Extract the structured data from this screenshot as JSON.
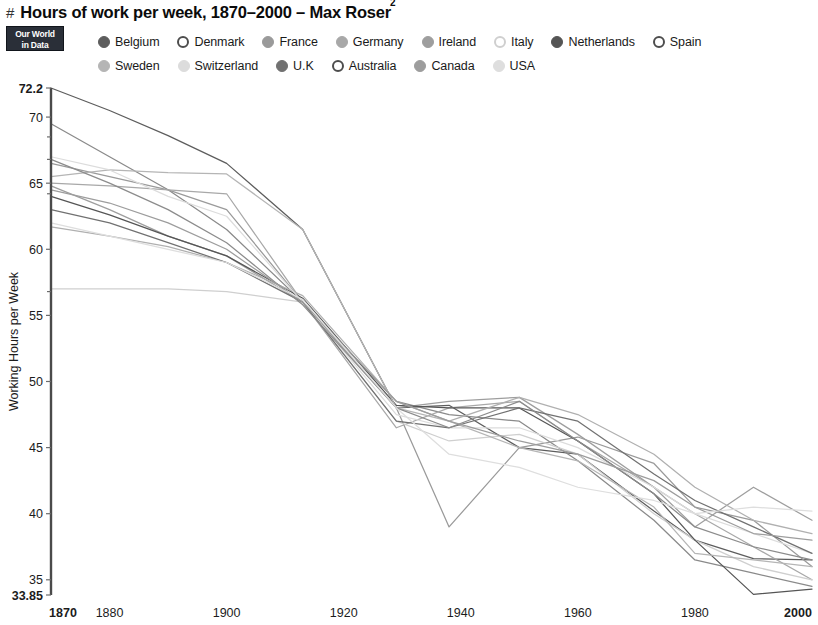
{
  "header": {
    "hash": "#",
    "title": "Hours of work per week, 1870–2000 – Max Roser",
    "title_superscript": "2"
  },
  "logo": {
    "line1": "Our World",
    "line2": "in Data"
  },
  "legend": {
    "rows": [
      [
        {
          "label": "Belgium",
          "color": "#5d5d5d",
          "filled": true
        },
        {
          "label": "Denmark",
          "color": "#4d4d4d",
          "filled": false
        },
        {
          "label": "France",
          "color": "#9a9a9a",
          "filled": true
        },
        {
          "label": "Germany",
          "color": "#a8a8a8",
          "filled": true
        },
        {
          "label": "Ireland",
          "color": "#9e9e9e",
          "filled": true
        },
        {
          "label": "Italy",
          "color": "#cfcfcf",
          "filled": false
        },
        {
          "label": "Netherlands",
          "color": "#555555",
          "filled": true
        },
        {
          "label": "Spain",
          "color": "#4d4d4d",
          "filled": false
        }
      ],
      [
        {
          "label": "Sweden",
          "color": "#b5b5b5",
          "filled": true
        },
        {
          "label": "Switzerland",
          "color": "#dcdcdc",
          "filled": true
        },
        {
          "label": "U.K",
          "color": "#717171",
          "filled": true
        },
        {
          "label": "Australia",
          "color": "#4d4d4d",
          "filled": false
        },
        {
          "label": "Canada",
          "color": "#9d9d9d",
          "filled": true
        },
        {
          "label": "USA",
          "color": "#dedede",
          "filled": true
        }
      ]
    ]
  },
  "chart_data": {
    "type": "line",
    "title": "Hours of work per week, 1870–2000 – Max Roser",
    "xlabel": "",
    "ylabel": "Working Hours per Week",
    "xlim": [
      1870,
      2000
    ],
    "ylim": [
      33.85,
      72.2
    ],
    "grid": false,
    "legend_position": "top",
    "x_ticks": [
      {
        "value": 1870,
        "label": "1870",
        "bold": true
      },
      {
        "value": 1880,
        "label": "1880",
        "bold": false
      },
      {
        "value": 1900,
        "label": "1900",
        "bold": false
      },
      {
        "value": 1920,
        "label": "1920",
        "bold": false
      },
      {
        "value": 1940,
        "label": "1940",
        "bold": false
      },
      {
        "value": 1960,
        "label": "1960",
        "bold": false
      },
      {
        "value": 1980,
        "label": "1980",
        "bold": false
      },
      {
        "value": 2000,
        "label": "2000",
        "bold": true
      }
    ],
    "y_ticks": [
      {
        "value": 72.2,
        "label": "72.2",
        "bold": true
      },
      {
        "value": 70,
        "label": "70",
        "bold": false
      },
      {
        "value": 65,
        "label": "65",
        "bold": false
      },
      {
        "value": 60,
        "label": "60",
        "bold": false
      },
      {
        "value": 55,
        "label": "55",
        "bold": false
      },
      {
        "value": 50,
        "label": "50",
        "bold": false
      },
      {
        "value": 45,
        "label": "45",
        "bold": false
      },
      {
        "value": 40,
        "label": "40",
        "bold": false
      },
      {
        "value": 35,
        "label": "35",
        "bold": false
      },
      {
        "value": 33.85,
        "label": "33.85",
        "bold": true
      }
    ],
    "y_minor_ticks": [
      68.5,
      66.8,
      64.2,
      56.8
    ],
    "series": [
      {
        "name": "Belgium",
        "color": "#5d5d5d",
        "x": [
          1870,
          1880,
          1890,
          1900,
          1913,
          1929,
          1938,
          1950,
          1960,
          1973,
          1980,
          1990,
          2000
        ],
        "y": [
          72.2,
          70.5,
          68.6,
          66.5,
          61.5,
          48.0,
          48.2,
          45.0,
          44.5,
          40.2,
          38.0,
          36.6,
          36.5
        ]
      },
      {
        "name": "Denmark",
        "color": "#8a8a8a",
        "x": [
          1870,
          1880,
          1890,
          1900,
          1913,
          1929,
          1938,
          1950,
          1960,
          1973,
          1980,
          1990,
          2000
        ],
        "y": [
          69.5,
          67.0,
          64.5,
          61.5,
          56.0,
          48.5,
          47.5,
          47.0,
          44.0,
          39.5,
          36.5,
          35.5,
          34.5
        ]
      },
      {
        "name": "France",
        "color": "#9a9a9a",
        "x": [
          1870,
          1880,
          1890,
          1900,
          1913,
          1929,
          1938,
          1950,
          1960,
          1973,
          1980,
          1990,
          2000
        ],
        "y": [
          66.5,
          65.5,
          64.5,
          63.0,
          56.0,
          48.0,
          39.0,
          45.0,
          45.8,
          43.8,
          40.5,
          39.5,
          36.0
        ]
      },
      {
        "name": "Germany",
        "color": "#a8a8a8",
        "x": [
          1870,
          1880,
          1890,
          1900,
          1913,
          1929,
          1938,
          1950,
          1960,
          1973,
          1980,
          1990,
          2000
        ],
        "y": [
          65.0,
          64.8,
          64.5,
          64.2,
          56.0,
          46.5,
          48.0,
          48.5,
          45.5,
          42.0,
          40.0,
          37.5,
          35.0
        ]
      },
      {
        "name": "Ireland",
        "color": "#9e9e9e",
        "x": [
          1870,
          1880,
          1890,
          1900,
          1913,
          1929,
          1938,
          1950,
          1960,
          1973,
          1980,
          1990,
          2000
        ],
        "y": [
          64.8,
          63.0,
          61.0,
          59.5,
          56.0,
          48.0,
          48.5,
          48.8,
          46.0,
          42.0,
          39.0,
          42.0,
          39.5
        ]
      },
      {
        "name": "Italy",
        "color": "#cfcfcf",
        "x": [
          1870,
          1880,
          1890,
          1900,
          1913,
          1929,
          1938,
          1950,
          1960,
          1973,
          1980,
          1990,
          2000
        ],
        "y": [
          57.0,
          57.0,
          57.0,
          56.8,
          56.0,
          47.0,
          45.5,
          46.0,
          44.5,
          40.0,
          38.0,
          36.0,
          35.0
        ]
      },
      {
        "name": "Netherlands",
        "color": "#555555",
        "x": [
          1870,
          1880,
          1890,
          1900,
          1913,
          1929,
          1938,
          1950,
          1960,
          1973,
          1980,
          1990,
          2000
        ],
        "y": [
          64.0,
          62.6,
          61.0,
          59.5,
          56.3,
          48.2,
          48.0,
          48.0,
          45.5,
          41.5,
          38.0,
          33.9,
          34.3
        ]
      },
      {
        "name": "Spain",
        "color": "#b0b0b0",
        "x": [
          1870,
          1880,
          1890,
          1900,
          1913,
          1929,
          1938,
          1950,
          1960,
          1973,
          1980,
          1990,
          2000
        ],
        "y": [
          61.7,
          61.0,
          60.2,
          59.0,
          56.5,
          48.5,
          47.0,
          48.8,
          47.5,
          44.5,
          42.0,
          39.5,
          38.5
        ]
      },
      {
        "name": "Sweden",
        "color": "#b5b5b5",
        "x": [
          1870,
          1880,
          1890,
          1900,
          1913,
          1929,
          1938,
          1950,
          1960,
          1973,
          1980,
          1990,
          2000
        ],
        "y": [
          65.5,
          66.0,
          65.8,
          65.7,
          61.5,
          48.0,
          47.0,
          45.0,
          44.0,
          40.5,
          37.0,
          36.5,
          36.0
        ]
      },
      {
        "name": "Switzerland",
        "color": "#dcdcdc",
        "x": [
          1870,
          1880,
          1890,
          1900,
          1913,
          1929,
          1938,
          1950,
          1960,
          1973,
          1980,
          1990,
          2000
        ],
        "y": [
          67.0,
          66.0,
          64.0,
          62.5,
          56.0,
          47.5,
          46.5,
          46.5,
          45.0,
          42.0,
          40.0,
          38.5,
          37.0
        ]
      },
      {
        "name": "U.K",
        "color": "#717171",
        "x": [
          1870,
          1880,
          1890,
          1900,
          1913,
          1929,
          1938,
          1950,
          1960,
          1973,
          1980,
          1990,
          2000
        ],
        "y": [
          63.0,
          62.0,
          60.5,
          59.0,
          56.0,
          47.0,
          46.5,
          48.0,
          47.0,
          43.0,
          41.0,
          39.0,
          37.0
        ]
      },
      {
        "name": "Australia",
        "color": "#8c8c8c",
        "x": [
          1870,
          1880,
          1890,
          1900,
          1913,
          1929,
          1938,
          1950,
          1960,
          1973,
          1980,
          1990,
          2000
        ],
        "y": [
          66.8,
          65.0,
          63.0,
          60.5,
          55.8,
          48.0,
          46.5,
          48.5,
          45.5,
          41.5,
          39.0,
          37.5,
          36.5
        ]
      },
      {
        "name": "Canada",
        "color": "#9d9d9d",
        "x": [
          1870,
          1880,
          1890,
          1900,
          1913,
          1929,
          1938,
          1950,
          1960,
          1973,
          1980,
          1990,
          2000
        ],
        "y": [
          64.5,
          63.5,
          62.0,
          60.0,
          56.0,
          48.5,
          47.0,
          45.5,
          44.5,
          42.5,
          40.5,
          38.5,
          38.0
        ]
      },
      {
        "name": "USA",
        "color": "#dedede",
        "x": [
          1870,
          1880,
          1890,
          1900,
          1913,
          1929,
          1938,
          1950,
          1960,
          1973,
          1980,
          1990,
          2000
        ],
        "y": [
          62.0,
          61.0,
          60.0,
          59.0,
          56.2,
          48.0,
          44.5,
          43.5,
          42.0,
          41.0,
          40.0,
          40.5,
          40.2
        ]
      }
    ]
  },
  "plot_geometry": {
    "left": 51,
    "right": 812,
    "top": 88,
    "bottom": 595
  }
}
